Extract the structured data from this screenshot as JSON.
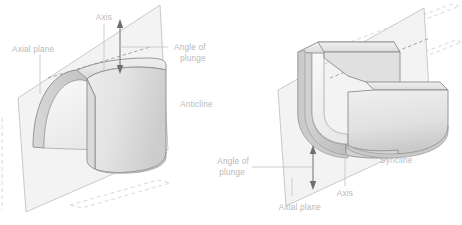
{
  "figure": {
    "background_color": "#ffffff",
    "label_color": "#b9b9b9",
    "leader_color": "#c2c2c2",
    "arrow_color": "#6e6e6e",
    "plane_fill": "#f2f2f2",
    "fold_fill_light": "#f4f4f4",
    "fold_fill_mid": "#e2e2e2",
    "fold_fill_dark": "#cfcfcf"
  },
  "panels": [
    {
      "id": "anticline",
      "name": "Anticline",
      "fold_type": "anticline",
      "description": "Arch-shaped upward fold of layered rock cut by an inclined axial plane, plunging to the left",
      "labels": {
        "axis": "Axis",
        "axial_plane": "Axial plane",
        "angle_of_plunge_line1": "Angle of",
        "angle_of_plunge_line2": "plunge",
        "fold_name": "Anticline"
      }
    },
    {
      "id": "syncline",
      "name": "Syncline",
      "fold_type": "syncline",
      "description": "U-shaped trough fold of layered rock cut by an inclined axial plane, plunging to the right",
      "labels": {
        "axis": "Axis",
        "axial_plane": "Axial plane",
        "angle_of_plunge_line1": "Angle of",
        "angle_of_plunge_line2": "plunge",
        "fold_name": "Syncline"
      }
    }
  ]
}
